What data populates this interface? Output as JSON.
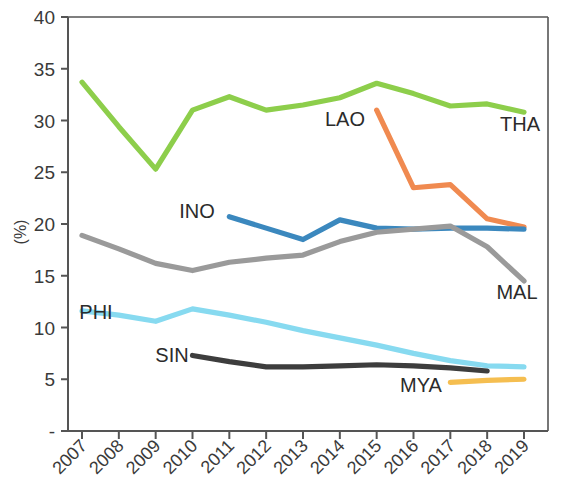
{
  "chart_data": {
    "type": "line",
    "title": "",
    "xlabel": "",
    "ylabel": "(%)",
    "ylim": [
      0,
      40
    ],
    "yticks": [
      0,
      5,
      10,
      15,
      20,
      25,
      30,
      35,
      40
    ],
    "ytick_labels": [
      "-",
      "5",
      "10",
      "15",
      "20",
      "25",
      "30",
      "35",
      "40"
    ],
    "grid": false,
    "legend_position": "inline-labels",
    "categories": [
      "2007",
      "2008",
      "2009",
      "2010",
      "2011",
      "2012",
      "2013",
      "2014",
      "2015",
      "2016",
      "2017",
      "2018",
      "2019"
    ],
    "x": [
      2007,
      2008,
      2009,
      2010,
      2011,
      2012,
      2013,
      2014,
      2015,
      2016,
      2017,
      2018,
      2019
    ],
    "series": [
      {
        "name": "THA",
        "label": "THA",
        "color": "#8DCE4B",
        "x": [
          2007,
          2008,
          2009,
          2010,
          2011,
          2012,
          2013,
          2014,
          2015,
          2016,
          2017,
          2018,
          2019
        ],
        "values": [
          33.7,
          29.4,
          25.3,
          31.0,
          32.3,
          31.0,
          31.5,
          32.2,
          33.6,
          32.6,
          31.4,
          31.6,
          30.8
        ]
      },
      {
        "name": "LAO",
        "label": "LAO",
        "color": "#F08A50",
        "x": [
          2015,
          2016,
          2017,
          2018,
          2019
        ],
        "values": [
          31.0,
          23.5,
          23.8,
          20.5,
          19.7
        ]
      },
      {
        "name": "INO",
        "label": "INO",
        "color": "#3B88BE",
        "x": [
          2011,
          2012,
          2013,
          2014,
          2015,
          2016,
          2017,
          2018,
          2019
        ],
        "values": [
          20.7,
          19.6,
          18.5,
          20.4,
          19.6,
          19.5,
          19.6,
          19.6,
          19.5
        ]
      },
      {
        "name": "MAL",
        "label": "MAL",
        "color": "#9A9A9A",
        "x": [
          2007,
          2008,
          2009,
          2010,
          2011,
          2012,
          2013,
          2014,
          2015,
          2016,
          2017,
          2018,
          2019
        ],
        "values": [
          18.9,
          17.6,
          16.2,
          15.5,
          16.3,
          16.7,
          17.0,
          18.3,
          19.2,
          19.5,
          19.8,
          17.8,
          14.5
        ]
      },
      {
        "name": "PHI",
        "label": "PHI",
        "color": "#87DAF0",
        "x": [
          2007,
          2008,
          2009,
          2010,
          2011,
          2012,
          2013,
          2014,
          2015,
          2016,
          2017,
          2018,
          2019
        ],
        "values": [
          11.6,
          11.2,
          10.6,
          11.8,
          11.2,
          10.5,
          9.7,
          9.0,
          8.3,
          7.5,
          6.8,
          6.3,
          6.2
        ]
      },
      {
        "name": "SIN",
        "label": "SIN",
        "color": "#3D3D3D",
        "x": [
          2010,
          2011,
          2012,
          2013,
          2014,
          2015,
          2016,
          2017,
          2018
        ],
        "values": [
          7.3,
          6.7,
          6.2,
          6.2,
          6.3,
          6.4,
          6.3,
          6.1,
          5.8
        ]
      },
      {
        "name": "MYA",
        "label": "MYA",
        "color": "#F5BE50",
        "x": [
          2017,
          2018,
          2019
        ],
        "values": [
          4.7,
          4.9,
          5.0
        ]
      }
    ],
    "series_labels": [
      {
        "name": "THA",
        "text": "THA",
        "x": 520,
        "y": 131
      },
      {
        "name": "LAO",
        "text": "LAO",
        "x": 345,
        "y": 126
      },
      {
        "name": "INO",
        "text": "INO",
        "x": 197,
        "y": 218
      },
      {
        "name": "MAL",
        "text": "MAL",
        "x": 517,
        "y": 299
      },
      {
        "name": "PHI",
        "text": "PHI",
        "x": 96,
        "y": 319
      },
      {
        "name": "SIN",
        "text": "SIN",
        "x": 172,
        "y": 362
      },
      {
        "name": "MYA",
        "text": "MYA",
        "x": 421,
        "y": 392
      }
    ]
  }
}
